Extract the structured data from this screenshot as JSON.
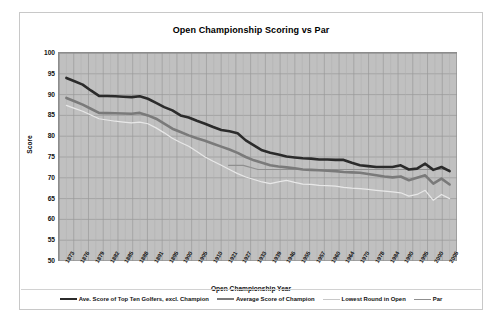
{
  "chart_data": {
    "type": "line",
    "title": "Open Championship Scoring vs Par",
    "xlabel": "Open Championship Year",
    "ylabel": "Score",
    "ylim": [
      50,
      100
    ],
    "ytick_step": 5,
    "yticks": [
      100,
      95,
      90,
      85,
      80,
      75,
      70,
      65,
      60,
      55,
      50
    ],
    "grid": true,
    "legend_position": "bottom",
    "background": "#c0c0c0",
    "categories": [
      "1873",
      "1876",
      "1879",
      "1882",
      "1885",
      "1888",
      "1891",
      "1895",
      "1900",
      "1905",
      "1910",
      "1921",
      "1927",
      "1933",
      "1939",
      "1946",
      "1955",
      "1957",
      "1960",
      "1964",
      "1970",
      "1978",
      "1984",
      "1990",
      "1995",
      "2000",
      "2005"
    ],
    "x": [
      1873,
      1876,
      1879,
      1882,
      1885,
      1888,
      1891,
      1895,
      1900,
      1905,
      1910,
      1921,
      1927,
      1933,
      1939,
      1946,
      1955,
      1957,
      1960,
      1964,
      1970,
      1978,
      1984,
      1990,
      1995,
      2000,
      2005
    ],
    "series": [
      {
        "name": "Ave. Score of Top Ten Golfers, excl. Champion",
        "color": "#2b2b2b",
        "width": 2.6,
        "values": [
          94.0,
          92.4,
          89.7,
          89.6,
          89.4,
          89.6,
          88.0,
          86.2,
          84.5,
          83.0,
          81.5,
          80.7,
          77.8,
          76.0,
          75.1,
          74.7,
          74.4,
          74.3,
          74.3,
          73.0,
          72.6,
          72.6,
          73.0,
          72.2,
          71.9,
          72.6,
          71.6
        ],
        "values_full": [
          94.0,
          93.2,
          92.4,
          91.0,
          89.7,
          89.65,
          89.6,
          89.5,
          89.4,
          89.6,
          89.0,
          88.0,
          87.0,
          86.2,
          85.0,
          84.5,
          83.7,
          83.0,
          82.2,
          81.5,
          81.2,
          80.7,
          79.0,
          77.8,
          76.6,
          76.0,
          75.6,
          75.1,
          74.9,
          74.7,
          74.6,
          74.4,
          74.4,
          74.3,
          74.3,
          73.6,
          73.0,
          72.8,
          72.6,
          72.6,
          72.6,
          73.0,
          72.0,
          72.2,
          73.4,
          71.9,
          72.6,
          71.6
        ]
      },
      {
        "name": "Average Score of Champion",
        "color": "#7a7a7a",
        "width": 2.6,
        "values": [
          89.2,
          87.6,
          85.6,
          85.5,
          85.4,
          85.6,
          84.2,
          81.8,
          80.2,
          78.9,
          77.5,
          76.0,
          74.2,
          73.0,
          72.5,
          72.0,
          71.8,
          71.6,
          71.2,
          70.6,
          70.1,
          70.3,
          70.0,
          69.0,
          68.6,
          69.8,
          68.4
        ],
        "values_full": [
          89.2,
          88.4,
          87.6,
          86.6,
          85.6,
          85.55,
          85.5,
          85.45,
          85.4,
          85.6,
          85.0,
          84.2,
          83.0,
          81.8,
          81.0,
          80.2,
          79.5,
          78.9,
          78.2,
          77.5,
          76.8,
          76.0,
          75.0,
          74.2,
          73.6,
          73.0,
          72.7,
          72.5,
          72.3,
          72.0,
          71.9,
          71.8,
          71.7,
          71.6,
          71.4,
          71.3,
          71.2,
          70.9,
          70.6,
          70.3,
          70.1,
          70.3,
          69.4,
          70.0,
          70.6,
          68.6,
          69.8,
          68.4
        ]
      },
      {
        "name": "Lowest Round in Open",
        "color": "#e8e8e8",
        "width": 1.2,
        "values": [
          87.4,
          86.0,
          84.2,
          83.6,
          83.2,
          83.4,
          82.0,
          79.5,
          77.6,
          75.0,
          73.0,
          71.0,
          69.6,
          68.6,
          69.4,
          68.5,
          68.2,
          68.0,
          67.4,
          67.0,
          66.6,
          66.4,
          66.0,
          64.6,
          65.6,
          66.0,
          65.0
        ],
        "values_full": [
          87.4,
          86.7,
          86.0,
          85.1,
          84.2,
          83.9,
          83.6,
          83.4,
          83.2,
          83.4,
          83.0,
          82.0,
          80.8,
          79.5,
          78.5,
          77.6,
          76.3,
          75.0,
          74.0,
          73.0,
          72.0,
          71.0,
          70.2,
          69.6,
          69.0,
          68.6,
          69.0,
          69.4,
          68.9,
          68.5,
          68.4,
          68.2,
          68.1,
          68.0,
          67.7,
          67.5,
          67.4,
          67.2,
          67.0,
          66.8,
          66.6,
          66.4,
          65.6,
          66.0,
          67.0,
          64.6,
          66.0,
          65.0
        ]
      },
      {
        "name": "Par",
        "color": "#8f8f8f",
        "width": 1.2,
        "values": [
          null,
          null,
          null,
          null,
          null,
          null,
          null,
          null,
          null,
          null,
          null,
          73.0,
          73.0,
          72.0,
          72.0,
          72.0,
          72.0,
          72.0,
          72.0,
          72.0,
          72.0,
          72.0,
          72.0,
          72.0,
          72.0,
          72.0,
          72.0
        ],
        "start_index": 11,
        "flat_value": 72
      }
    ]
  },
  "chart": {
    "title": "Open Championship Scoring vs Par",
    "y_axis_title": "Score",
    "x_axis_title": "Open Championship Year"
  },
  "legend": {
    "items": [
      {
        "label": "Ave. Score of Top Ten Golfers, excl. Champion",
        "color": "#2b2b2b",
        "width": 2.6
      },
      {
        "label": "Average Score of Champion",
        "color": "#7a7a7a",
        "width": 2.6
      },
      {
        "label": "Lowest Round in Open",
        "color": "#c8c8c8",
        "width": 1.4
      },
      {
        "label": "Par",
        "color": "#8f8f8f",
        "width": 1.4
      }
    ]
  }
}
